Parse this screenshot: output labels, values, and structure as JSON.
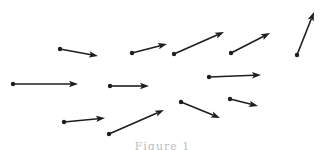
{
  "figure": {
    "type": "vector-arrows",
    "stroke_color": "#1e1e1e",
    "caption_color": "#bdbdbd",
    "arrows": [
      {
        "id": 1,
        "from": [
          60,
          49
        ],
        "to": [
          98,
          56
        ]
      },
      {
        "id": 2,
        "from": [
          13,
          84
        ],
        "to": [
          78,
          84
        ]
      },
      {
        "id": 3,
        "from": [
          132,
          53
        ],
        "to": [
          167,
          44
        ]
      },
      {
        "id": 4,
        "from": [
          174,
          54
        ],
        "to": [
          224,
          32
        ]
      },
      {
        "id": 5,
        "from": [
          231,
          53
        ],
        "to": [
          270,
          33
        ]
      },
      {
        "id": 6,
        "from": [
          297,
          55
        ],
        "to": [
          314,
          12
        ]
      },
      {
        "id": 7,
        "from": [
          110,
          86
        ],
        "to": [
          149,
          86
        ]
      },
      {
        "id": 8,
        "from": [
          209,
          77
        ],
        "to": [
          261,
          75
        ]
      },
      {
        "id": 9,
        "from": [
          64,
          122
        ],
        "to": [
          105,
          118
        ]
      },
      {
        "id": 10,
        "from": [
          109,
          134
        ],
        "to": [
          164,
          110
        ]
      },
      {
        "id": 11,
        "from": [
          181,
          102
        ],
        "to": [
          220,
          118
        ]
      },
      {
        "id": 12,
        "from": [
          230,
          99
        ],
        "to": [
          258,
          106
        ]
      }
    ],
    "caption": "Figure 1"
  }
}
